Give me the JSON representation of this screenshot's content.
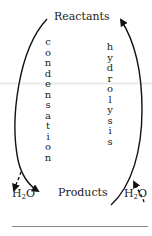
{
  "diagram": {
    "top_label": "Reactants",
    "bottom_label": "Products",
    "left_process": "condensation",
    "right_process": "hydrolysis",
    "water_left": {
      "base": "H",
      "subscript": "2",
      "tail": "O"
    },
    "water_right": {
      "base": "H",
      "subscript": "2",
      "tail": "O"
    },
    "arrows": [
      {
        "from": "Reactants",
        "to": "H2O + Products side",
        "style": "solid",
        "side": "left",
        "direction": "down"
      },
      {
        "from": "left arc",
        "to": "H2O (left)",
        "style": "dashed",
        "meaning": "water released"
      },
      {
        "from": "Products",
        "to": "Reactants",
        "style": "solid",
        "side": "right",
        "direction": "up"
      },
      {
        "from": "H2O (right)",
        "to": "right arc",
        "style": "dashed",
        "meaning": "water consumed"
      }
    ]
  }
}
